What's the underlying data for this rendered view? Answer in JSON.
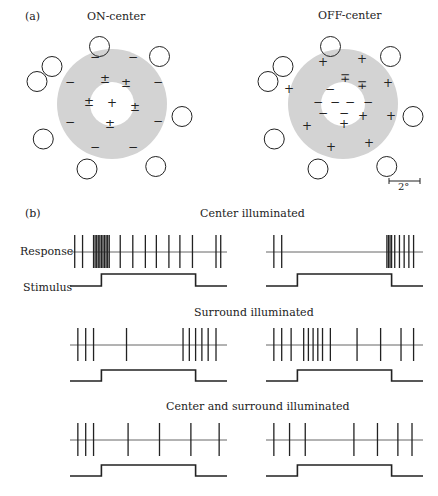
{
  "panel_a": {
    "label": "(a)",
    "on_center": {
      "title": "ON-center",
      "center_marks": [
        "±",
        "±",
        "±",
        "+",
        "±",
        "±"
      ],
      "surround_marks": [
        "−",
        "−",
        "−",
        "−",
        "−",
        "−",
        "−",
        "−"
      ]
    },
    "off_center": {
      "title": "OFF-center",
      "center_marks": [
        "∓",
        "∓",
        "−",
        "−",
        "−",
        "−",
        "−",
        "−",
        "−",
        "+",
        "+"
      ],
      "surround_marks": [
        "+",
        "+",
        "+",
        "+",
        "+",
        "+",
        "+",
        "+"
      ]
    },
    "scale_bar": "2°"
  },
  "panel_b": {
    "label": "(b)",
    "row_labels": {
      "response": "Response",
      "stimulus": "Stimulus"
    },
    "conditions": [
      {
        "title": "Center illuminated"
      },
      {
        "title": "Surround illuminated"
      },
      {
        "title": "Center and surround illuminated"
      }
    ]
  },
  "colors": {
    "surround_gray": "#d3d3d3",
    "line": "#222222"
  },
  "chart_data": {
    "type": "raster",
    "stimulus_window": [
      0.2,
      0.8
    ],
    "series": [
      {
        "name": "Center illuminated / ON-center",
        "spike_times_rel": [
          0.03,
          0.08,
          0.15,
          0.16,
          0.17,
          0.18,
          0.19,
          0.2,
          0.21,
          0.22,
          0.23,
          0.24,
          0.25,
          0.32,
          0.4,
          0.48,
          0.55,
          0.63,
          0.7,
          0.78,
          0.93,
          0.96
        ]
      },
      {
        "name": "Center illuminated / OFF-center",
        "spike_times_rel": [
          0.05,
          0.1,
          0.77,
          0.78,
          0.79,
          0.8,
          0.82,
          0.85,
          0.88,
          0.91,
          0.94
        ]
      },
      {
        "name": "Surround illuminated / ON-center",
        "spike_times_rel": [
          0.05,
          0.1,
          0.15,
          0.36,
          0.72,
          0.76,
          0.8,
          0.84,
          0.88,
          0.93
        ]
      },
      {
        "name": "Surround illuminated / OFF-center",
        "spike_times_rel": [
          0.05,
          0.1,
          0.16,
          0.24,
          0.27,
          0.3,
          0.33,
          0.36,
          0.41,
          0.58,
          0.73,
          0.86,
          0.94
        ]
      },
      {
        "name": "Center and surround illuminated / ON-center",
        "spike_times_rel": [
          0.05,
          0.1,
          0.15,
          0.37,
          0.57,
          0.77,
          0.95
        ]
      },
      {
        "name": "Center and surround illuminated / OFF-center",
        "spike_times_rel": [
          0.05,
          0.15,
          0.25,
          0.56,
          0.71,
          0.84,
          0.93
        ]
      }
    ]
  }
}
